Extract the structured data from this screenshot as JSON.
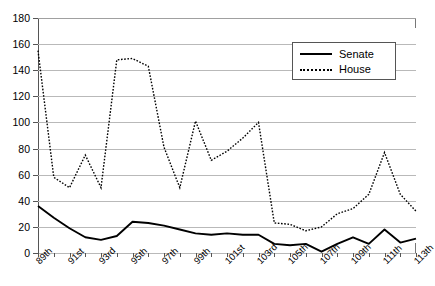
{
  "chart_data": {
    "type": "line",
    "title": "",
    "subtitle": "",
    "xlabel": "",
    "ylabel": "",
    "ylim": [
      0,
      180
    ],
    "ytick_values": [
      0,
      20,
      40,
      60,
      80,
      100,
      120,
      140,
      160,
      180
    ],
    "ytick_labels": [
      "0",
      "20",
      "40",
      "60",
      "80",
      "100",
      "120",
      "140",
      "160",
      "180"
    ],
    "grid": true,
    "legend_position": "top-right",
    "legend": [
      "Senate",
      "House"
    ],
    "categories": [
      "89th",
      "90th",
      "91st",
      "92nd",
      "93rd",
      "94th",
      "95th",
      "96th",
      "97th",
      "98th",
      "99th",
      "100th",
      "101st",
      "102nd",
      "103rd",
      "104th",
      "105th",
      "106th",
      "107th",
      "108th",
      "109th",
      "110th",
      "111th",
      "112th",
      "113th"
    ],
    "xtick_labels": [
      "89th",
      "91st",
      "93rd",
      "95th",
      "97th",
      "99th",
      "101st",
      "103rd",
      "105th",
      "107th",
      "109th",
      "111th",
      "113th"
    ],
    "xtick_label_indices": [
      0,
      2,
      4,
      6,
      8,
      10,
      12,
      14,
      16,
      18,
      20,
      22,
      24
    ],
    "series": [
      {
        "name": "Senate",
        "style": "solid",
        "values": [
          36,
          27,
          19,
          12,
          10,
          13,
          24,
          23,
          21,
          18,
          15,
          14,
          15,
          14,
          14,
          7,
          6,
          7,
          1,
          7,
          12,
          7,
          18,
          8,
          11
        ]
      },
      {
        "name": "House",
        "style": "dotted",
        "values": [
          155,
          58,
          50,
          75,
          50,
          148,
          149,
          143,
          81,
          50,
          101,
          71,
          78,
          88,
          100,
          23,
          22,
          17,
          20,
          30,
          34,
          45,
          77,
          45,
          32
        ]
      }
    ]
  },
  "legend": {
    "senate_label": "Senate",
    "house_label": "House"
  }
}
